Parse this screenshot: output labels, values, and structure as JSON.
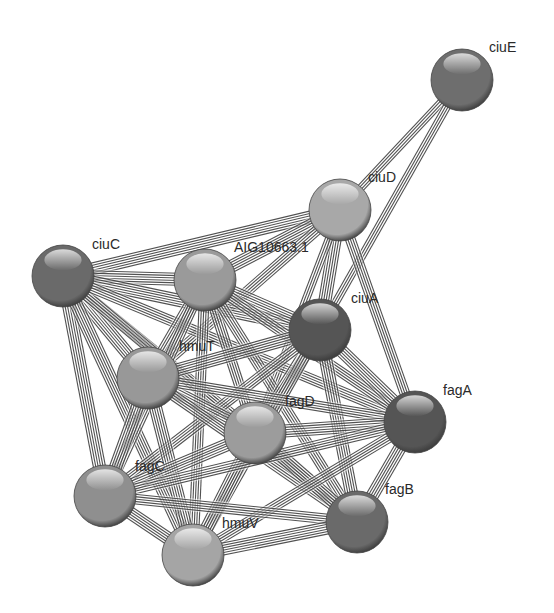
{
  "diagram": {
    "type": "protein-interaction-network",
    "style": {
      "background": "#ffffff",
      "edge_color": "#333333",
      "edge_gap_color": "#ffffff",
      "label_color": "#2a2a2a",
      "node_radius": 31
    },
    "nodes": [
      {
        "id": "ciuE",
        "label": "ciuE",
        "x": 462,
        "y": 80,
        "shade": "#6e6e6e",
        "lx": 489,
        "ly": 52
      },
      {
        "id": "ciuD",
        "label": "ciuD",
        "x": 340,
        "y": 210,
        "shade": "#a8a8a8",
        "lx": 368,
        "ly": 182
      },
      {
        "id": "ciuC",
        "label": "ciuC",
        "x": 63,
        "y": 276,
        "shade": "#6a6a6a",
        "lx": 92,
        "ly": 249
      },
      {
        "id": "AIG10663.1",
        "label": "AIG10663.1",
        "x": 205,
        "y": 280,
        "shade": "#9a9a9a",
        "lx": 234,
        "ly": 252
      },
      {
        "id": "ciuA",
        "label": "ciuA",
        "x": 320,
        "y": 330,
        "shade": "#555555",
        "lx": 351,
        "ly": 303
      },
      {
        "id": "hmuT",
        "label": "hmuT",
        "x": 148,
        "y": 378,
        "shade": "#989898",
        "lx": 179,
        "ly": 351
      },
      {
        "id": "fagD",
        "label": "fagD",
        "x": 255,
        "y": 433,
        "shade": "#9c9c9c",
        "lx": 285,
        "ly": 406
      },
      {
        "id": "fagA",
        "label": "fagA",
        "x": 415,
        "y": 422,
        "shade": "#555555",
        "lx": 443,
        "ly": 395
      },
      {
        "id": "fagC",
        "label": "fagC",
        "x": 105,
        "y": 496,
        "shade": "#8f8f8f",
        "lx": 135,
        "ly": 471
      },
      {
        "id": "fagB",
        "label": "fagB",
        "x": 357,
        "y": 522,
        "shade": "#6a6a6a",
        "lx": 385,
        "ly": 494
      },
      {
        "id": "hmuV",
        "label": "hmuV",
        "x": 193,
        "y": 555,
        "shade": "#a5a5a5",
        "lx": 222,
        "ly": 528
      }
    ],
    "edges": [
      {
        "source": "ciuE",
        "target": "ciuD",
        "lines": 4
      },
      {
        "source": "ciuE",
        "target": "ciuA",
        "lines": 4
      },
      {
        "source": "ciuD",
        "target": "ciuC",
        "lines": 6
      },
      {
        "source": "ciuD",
        "target": "AIG10663.1",
        "lines": 6
      },
      {
        "source": "ciuD",
        "target": "ciuA",
        "lines": 6
      },
      {
        "source": "ciuD",
        "target": "hmuT",
        "lines": 5
      },
      {
        "source": "ciuD",
        "target": "fagA",
        "lines": 5
      },
      {
        "source": "ciuD",
        "target": "fagD",
        "lines": 4
      },
      {
        "source": "ciuC",
        "target": "AIG10663.1",
        "lines": 6
      },
      {
        "source": "ciuC",
        "target": "ciuA",
        "lines": 6
      },
      {
        "source": "ciuC",
        "target": "hmuT",
        "lines": 6
      },
      {
        "source": "ciuC",
        "target": "fagC",
        "lines": 6
      },
      {
        "source": "ciuC",
        "target": "hmuV",
        "lines": 6
      },
      {
        "source": "ciuC",
        "target": "fagD",
        "lines": 5
      },
      {
        "source": "ciuC",
        "target": "fagB",
        "lines": 5
      },
      {
        "source": "ciuC",
        "target": "fagA",
        "lines": 5
      },
      {
        "source": "AIG10663.1",
        "target": "ciuA",
        "lines": 6
      },
      {
        "source": "AIG10663.1",
        "target": "hmuT",
        "lines": 6
      },
      {
        "source": "AIG10663.1",
        "target": "fagD",
        "lines": 5
      },
      {
        "source": "AIG10663.1",
        "target": "fagA",
        "lines": 5
      },
      {
        "source": "AIG10663.1",
        "target": "fagC",
        "lines": 5
      },
      {
        "source": "AIG10663.1",
        "target": "fagB",
        "lines": 5
      },
      {
        "source": "AIG10663.1",
        "target": "hmuV",
        "lines": 5
      },
      {
        "source": "ciuA",
        "target": "hmuT",
        "lines": 6
      },
      {
        "source": "ciuA",
        "target": "fagD",
        "lines": 6
      },
      {
        "source": "ciuA",
        "target": "fagA",
        "lines": 6
      },
      {
        "source": "ciuA",
        "target": "fagC",
        "lines": 5
      },
      {
        "source": "ciuA",
        "target": "fagB",
        "lines": 6
      },
      {
        "source": "ciuA",
        "target": "hmuV",
        "lines": 5
      },
      {
        "source": "hmuT",
        "target": "fagD",
        "lines": 6
      },
      {
        "source": "hmuT",
        "target": "fagA",
        "lines": 5
      },
      {
        "source": "hmuT",
        "target": "fagC",
        "lines": 6
      },
      {
        "source": "hmuT",
        "target": "fagB",
        "lines": 5
      },
      {
        "source": "hmuT",
        "target": "hmuV",
        "lines": 6
      },
      {
        "source": "fagD",
        "target": "fagA",
        "lines": 6
      },
      {
        "source": "fagD",
        "target": "fagC",
        "lines": 6
      },
      {
        "source": "fagD",
        "target": "fagB",
        "lines": 6
      },
      {
        "source": "fagD",
        "target": "hmuV",
        "lines": 6
      },
      {
        "source": "fagA",
        "target": "fagC",
        "lines": 5
      },
      {
        "source": "fagA",
        "target": "fagB",
        "lines": 6
      },
      {
        "source": "fagA",
        "target": "hmuV",
        "lines": 5
      },
      {
        "source": "fagC",
        "target": "fagB",
        "lines": 5
      },
      {
        "source": "fagC",
        "target": "hmuV",
        "lines": 6
      },
      {
        "source": "fagB",
        "target": "hmuV",
        "lines": 6
      }
    ]
  }
}
